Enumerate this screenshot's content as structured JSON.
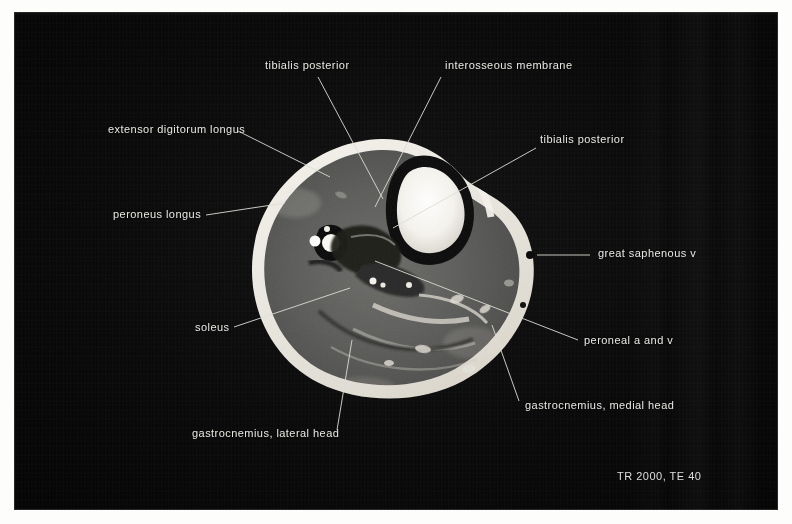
{
  "figure": {
    "modality": "MRI",
    "view": "axial cross-section of the lower leg (calf)",
    "scan_parameters": "TR 2000, TE 40"
  },
  "labels": [
    {
      "id": "tibialis-posterior-top",
      "text": "tibialis posterior",
      "text_x": 265,
      "text_y": 70,
      "anchor": "start",
      "leader": {
        "x1": 318,
        "y1": 77,
        "x2": 383,
        "y2": 199
      }
    },
    {
      "id": "interosseous-membrane",
      "text": "interosseous membrane",
      "text_x": 445,
      "text_y": 70,
      "anchor": "start",
      "leader": {
        "x1": 441,
        "y1": 77,
        "x2": 375,
        "y2": 207
      }
    },
    {
      "id": "extensor-digitorum-longus",
      "text": "extensor digitorum longus",
      "text_x": 108,
      "text_y": 134,
      "anchor": "start",
      "leader": {
        "x1": 238,
        "y1": 131,
        "x2": 330,
        "y2": 177
      }
    },
    {
      "id": "tibialis-posterior-right",
      "text": "tibialis posterior",
      "text_x": 540,
      "text_y": 144,
      "anchor": "start",
      "leader": {
        "x1": 536,
        "y1": 148,
        "x2": 393,
        "y2": 228
      }
    },
    {
      "id": "peroneus-longus",
      "text": "peroneus longus",
      "text_x": 113,
      "text_y": 219,
      "anchor": "start",
      "leader": {
        "x1": 206,
        "y1": 215,
        "x2": 285,
        "y2": 203
      }
    },
    {
      "id": "great-saphenous-v",
      "text": "great saphenous v",
      "text_x": 598,
      "text_y": 258,
      "anchor": "start",
      "leader": {
        "x1": 590,
        "y1": 255,
        "x2": 537,
        "y2": 255
      }
    },
    {
      "id": "soleus",
      "text": "soleus",
      "text_x": 195,
      "text_y": 332,
      "anchor": "start",
      "leader": {
        "x1": 234,
        "y1": 327,
        "x2": 350,
        "y2": 288
      }
    },
    {
      "id": "peroneal-a-and-v",
      "text": "peroneal a and v",
      "text_x": 584,
      "text_y": 345,
      "anchor": "start",
      "leader": {
        "x1": 578,
        "y1": 340,
        "x2": 375,
        "y2": 261
      }
    },
    {
      "id": "gastrocnemius-medial-head",
      "text": "gastrocnemius, medial head",
      "text_x": 525,
      "text_y": 410,
      "anchor": "start",
      "leader": {
        "x1": 519,
        "y1": 401,
        "x2": 492,
        "y2": 325
      }
    },
    {
      "id": "gastrocnemius-lateral-head",
      "text": "gastrocnemius, lateral head",
      "text_x": 192,
      "text_y": 438,
      "anchor": "start",
      "leader": {
        "x1": 337,
        "y1": 430,
        "x2": 352,
        "y2": 340
      }
    }
  ],
  "annotation": {
    "tr_te": "TR 2000, TE 40",
    "x": 617,
    "y": 481
  },
  "colors": {
    "plate_background": "#050505",
    "page_background": "#fdfdfb",
    "label_text": "#e9e9e4",
    "leader_line": "#dcdcd6",
    "fat_rim": "#f2f0ea",
    "muscle": "#5a5a58",
    "bone_marrow": "#fbfaf5",
    "cortical_bone": "#090909"
  }
}
